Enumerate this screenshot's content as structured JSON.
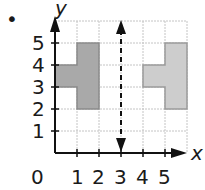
{
  "problem": {
    "bullet": "•",
    "axis_labels": {
      "x": "x",
      "y": "y"
    },
    "origin_label": "0",
    "x_ticks": [
      "1",
      "2",
      "3",
      "4",
      "5"
    ],
    "y_ticks": [
      "1",
      "2",
      "3",
      "4",
      "5"
    ],
    "grid": {
      "xmin": 0,
      "xmax": 6,
      "ymin": 0,
      "ymax": 6
    },
    "line_of_reflection": {
      "x": 3,
      "style": "dashed",
      "arrows": "both"
    },
    "shapes": [
      {
        "name": "original",
        "color": "#a8a8a8",
        "points": [
          [
            0,
            4
          ],
          [
            1,
            4
          ],
          [
            1,
            5
          ],
          [
            2,
            5
          ],
          [
            2,
            2
          ],
          [
            1,
            2
          ],
          [
            1,
            3
          ],
          [
            0,
            3
          ]
        ]
      },
      {
        "name": "image",
        "color": "#c8c8c8",
        "points": [
          [
            4,
            4
          ],
          [
            5,
            4
          ],
          [
            5,
            5
          ],
          [
            6,
            5
          ],
          [
            6,
            2
          ],
          [
            5,
            2
          ],
          [
            5,
            3
          ],
          [
            4,
            3
          ]
        ]
      }
    ]
  }
}
